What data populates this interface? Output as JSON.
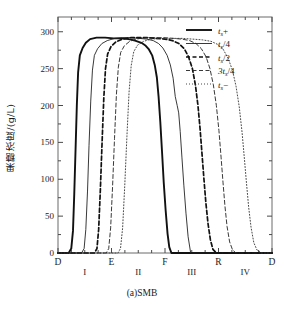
{
  "figure": {
    "caption": "(a)SMB",
    "y_axis_title": "果糖浓度/(g/L)"
  },
  "chart_data": {
    "type": "line",
    "title": "(a)SMB",
    "xlabel": "",
    "ylabel": "果糖浓度/(g/L)",
    "ylim": [
      0,
      320
    ],
    "yticks": [
      0,
      50,
      100,
      150,
      200,
      250,
      300
    ],
    "ytick_labels": [
      "0",
      "50",
      "100",
      "150",
      "200",
      "250",
      "300"
    ],
    "y_minor_tick_step": 25,
    "xlim": [
      0,
      100
    ],
    "grid": false,
    "legend_position": "top-right",
    "port_labels": [
      {
        "label": "D",
        "x": 0
      },
      {
        "label": "E",
        "x": 25
      },
      {
        "label": "F",
        "x": 50
      },
      {
        "label": "R",
        "x": 75
      },
      {
        "label": "D",
        "x": 100
      }
    ],
    "zone_labels": [
      {
        "label": "I",
        "x": 12.5
      },
      {
        "label": "II",
        "x": 37.5
      },
      {
        "label": "III",
        "x": 62.5
      },
      {
        "label": "IV",
        "x": 87.5
      }
    ],
    "plateau_value": 292,
    "series": [
      {
        "name": "t_s+",
        "legend_label": "ts+",
        "style": "solid",
        "width": 1.9,
        "color": "#111111",
        "x": [
          0,
          5.0,
          6.2,
          7.0,
          7.6,
          8.2,
          8.8,
          9.4,
          10.2,
          11.5,
          13.0,
          15.0,
          18.0,
          22.0,
          26.0,
          30.0,
          33.0,
          36.0,
          39.0,
          41.0,
          42.5,
          44.0,
          45.2,
          46.2,
          47.0,
          47.8,
          48.6,
          49.4,
          50.3,
          51.2,
          52.0,
          53.0,
          100
        ],
        "y": [
          0,
          0,
          6,
          30,
          80,
          140,
          200,
          245,
          268,
          278,
          285,
          290,
          292,
          292,
          291,
          291,
          290,
          288,
          285,
          281,
          276,
          268,
          255,
          238,
          212,
          178,
          138,
          96,
          58,
          26,
          8,
          0,
          0
        ]
      },
      {
        "name": "t_s/4",
        "legend_label": "ts/4",
        "style": "solid",
        "width": 0.9,
        "color": "#222222",
        "x": [
          0,
          11.0,
          12.2,
          13.0,
          13.8,
          14.5,
          15.3,
          16.1,
          17.0,
          18.5,
          20.5,
          23.0,
          26.5,
          30.0,
          34.0,
          38.0,
          41.5,
          44.5,
          47.0,
          49.0,
          51.0,
          52.5,
          53.8,
          54.8,
          55.7,
          56.4,
          57.1,
          57.9,
          58.8,
          59.8,
          60.8,
          62.0,
          100
        ],
        "y": [
          0,
          0,
          6,
          32,
          84,
          146,
          206,
          248,
          268,
          277,
          284,
          288,
          291,
          292,
          292,
          291,
          290,
          288,
          284,
          278,
          268,
          255,
          237,
          212,
          200,
          190,
          165,
          130,
          92,
          54,
          22,
          0,
          0
        ]
      },
      {
        "name": "t_s/2",
        "legend_label": "ts/2",
        "style": "dashed-bold",
        "width": 1.7,
        "color": "#111111",
        "dash": "4,2.5",
        "x": [
          0,
          17.0,
          18.2,
          19.0,
          19.8,
          20.6,
          21.4,
          22.2,
          23.2,
          24.8,
          27.0,
          30.0,
          34.0,
          38.0,
          42.0,
          46.0,
          50.0,
          53.5,
          56.5,
          59.0,
          61.0,
          62.8,
          64.2,
          65.4,
          66.4,
          67.3,
          68.2,
          69.1,
          70.1,
          71.2,
          72.4,
          74.0,
          100
        ],
        "y": [
          0,
          0,
          6,
          32,
          86,
          150,
          210,
          250,
          270,
          280,
          286,
          290,
          292,
          292,
          292,
          291,
          290,
          288,
          284,
          277,
          266,
          250,
          228,
          200,
          168,
          134,
          100,
          68,
          40,
          18,
          5,
          0,
          0
        ]
      },
      {
        "name": "3t_s/4",
        "legend_label": "3ts/4",
        "style": "dashed",
        "width": 0.9,
        "color": "#222222",
        "dash": "4,2.5",
        "x": [
          0,
          22.5,
          23.7,
          24.6,
          25.5,
          26.4,
          27.3,
          28.2,
          29.3,
          31.0,
          33.5,
          36.5,
          40.5,
          45.0,
          49.5,
          54.0,
          58.0,
          61.5,
          64.5,
          67.0,
          69.2,
          71.0,
          72.6,
          74.0,
          75.2,
          76.2,
          77.1,
          78.0,
          79.0,
          80.2,
          81.6,
          83.2,
          100
        ],
        "y": [
          0,
          0,
          6,
          34,
          90,
          155,
          215,
          252,
          272,
          281,
          287,
          290,
          292,
          292,
          292,
          291,
          290,
          288,
          284,
          277,
          266,
          250,
          228,
          200,
          166,
          130,
          96,
          64,
          36,
          15,
          4,
          0,
          0
        ]
      },
      {
        "name": "t_s-",
        "legend_label": "ts-",
        "style": "dotted",
        "width": 0.9,
        "color": "#333333",
        "dash": "1,2",
        "x": [
          0,
          28.0,
          29.2,
          30.2,
          31.2,
          32.2,
          33.2,
          34.2,
          35.4,
          37.2,
          40.0,
          43.5,
          48.0,
          53.0,
          58.0,
          63.0,
          67.5,
          71.5,
          74.5,
          77.2,
          79.5,
          81.5,
          83.2,
          84.7,
          86.0,
          87.1,
          88.1,
          89.1,
          90.2,
          91.5,
          93.0,
          95.0,
          100
        ],
        "y": [
          0,
          0,
          6,
          34,
          92,
          158,
          218,
          254,
          273,
          282,
          287,
          290,
          291,
          291,
          291,
          290,
          289,
          287,
          283,
          276,
          264,
          248,
          226,
          198,
          164,
          128,
          94,
          62,
          35,
          14,
          4,
          0,
          0
        ]
      }
    ],
    "legend_entries": [
      {
        "label_main": "t",
        "label_sub": "s",
        "label_post": "+",
        "style": "solid-bold"
      },
      {
        "label_main": "t",
        "label_sub": "s",
        "label_post": "/4",
        "style": "solid"
      },
      {
        "label_main": "t",
        "label_sub": "s",
        "label_post": "/2",
        "style": "dashed-bold"
      },
      {
        "label_main": "3t",
        "label_sub": "s",
        "label_post": "/4",
        "style": "dashed"
      },
      {
        "label_main": "t",
        "label_sub": "s",
        "label_post": "−",
        "style": "dotted"
      }
    ]
  }
}
